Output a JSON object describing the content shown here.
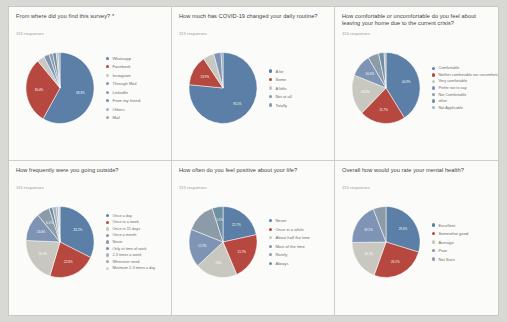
{
  "page": {
    "background": "#d8d8d4",
    "card_background": "#fbfbf9"
  },
  "palette": {
    "c1": "#5b7fa6",
    "c2": "#b6483f",
    "c3": "#c8c8c0",
    "c4": "#7f93b5",
    "c5": "#8b9ba8",
    "c6": "#6f8fa3",
    "c7": "#a7b4bd",
    "c8": "#9aa9b6",
    "c9": "#cfd4d6"
  },
  "charts": [
    {
      "id": "survey-source",
      "title": "From where did you find this survey? *",
      "responses": "115 responses",
      "chart_data": {
        "type": "pie",
        "title": "From where did you find this survey? *",
        "legend_position": "right",
        "categories": [
          "Whatsapp",
          "Facebook",
          "Instagram",
          "Through Mail",
          "LinkedIn",
          "From my friend",
          "Others",
          "Mail"
        ],
        "values": [
          58.3,
          30.4,
          3.5,
          2.6,
          1.7,
          1.7,
          0.9,
          0.9
        ],
        "labels": [
          "58.3%",
          "30.4%",
          "",
          "",
          "",
          "",
          "",
          ""
        ]
      }
    },
    {
      "id": "routine-change",
      "title": "How much has COVID-19 changed your daily routine?",
      "responses": "115 responses",
      "chart_data": {
        "type": "pie",
        "title": "How much has COVID-19 changed your daily routine?",
        "legend_position": "right",
        "categories": [
          "A lot",
          "Some",
          "A little",
          "Not at all",
          "Totally"
        ],
        "values": [
          76.5,
          13.9,
          5.2,
          3.5,
          0.9
        ],
        "labels": [
          "76.5%",
          "13.9%",
          "",
          "",
          ""
        ]
      }
    },
    {
      "id": "leaving-home-comfort",
      "title": "How comfortable or uncomfortable do you feel about leaving your home due to the current crisis?",
      "responses": "115 responses",
      "chart_data": {
        "type": "pie",
        "title": "How comfortable or uncomfortable do you feel about leaving your home due to the current crisis?",
        "legend_position": "right",
        "categories": [
          "Comfortable",
          "Neither comfortable nor uncomfortable",
          "Very comfortable",
          "Prefer not to say",
          "Not Comfortable",
          "other",
          "Not Applicable"
        ],
        "values": [
          40.9,
          21.7,
          18.3,
          10.4,
          5.2,
          2.6,
          0.9
        ],
        "labels": [
          "40.9%",
          "21.7%",
          "18.3%",
          "10.4%",
          "",
          "",
          ""
        ]
      }
    },
    {
      "id": "going-outside-frequency",
      "title": "How frequently were you going outside?",
      "responses": "115 responses",
      "chart_data": {
        "type": "pie",
        "title": "How frequently were you going outside?",
        "legend_position": "right",
        "categories": [
          "Once a day",
          "Once in a week",
          "Once in 15 days",
          "Once a month",
          "Never",
          "Only at time of work",
          "2-3 times a week",
          "Whenever need",
          "Minimum 2-3 times a day"
        ],
        "values": [
          32.2,
          22.6,
          20.9,
          13.0,
          6.1,
          1.7,
          1.7,
          0.9,
          0.9
        ],
        "labels": [
          "32.2%",
          "22.6%",
          "20.9%",
          "13.0%",
          "6.1%",
          "",
          "",
          "",
          ""
        ]
      }
    },
    {
      "id": "positive-about-life",
      "title": "How often do you feel positive about your life?",
      "responses": "115 responses",
      "chart_data": {
        "type": "pie",
        "title": "How often do you feel positive about your life?",
        "legend_position": "right",
        "categories": [
          "Never",
          "Once in a while",
          "About half the time",
          "Most of the time",
          "Rarely",
          "Always"
        ],
        "values": [
          21.7,
          21.7,
          20.0,
          17.4,
          14.1,
          5.1
        ],
        "labels": [
          "21.7%",
          "21.7%",
          "20%",
          "17.2%",
          "",
          "5.1%"
        ]
      }
    },
    {
      "id": "mental-health-rating",
      "title": "Overall how would you rate your mental health?",
      "responses": "115 responses",
      "chart_data": {
        "type": "pie",
        "title": "Overall how would you rate your mental health?",
        "legend_position": "right",
        "categories": [
          "Excellent",
          "Somewhat good",
          "Average",
          "Poor",
          "Not Sure"
        ],
        "values": [
          29.6,
          26.1,
          19.1,
          19.1,
          6.1
        ],
        "labels": [
          "29.6%",
          "26.1%",
          "19.1%",
          "19.1%",
          ""
        ]
      }
    }
  ]
}
